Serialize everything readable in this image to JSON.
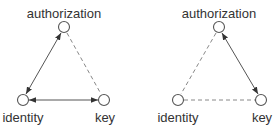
{
  "diagrams": [
    {
      "name": "left-triangle",
      "nodes": {
        "authorization": {
          "label": "authorization",
          "x": 64,
          "y": 27
        },
        "identity": {
          "label": "identity",
          "x": 23,
          "y": 100
        },
        "key": {
          "label": "key",
          "x": 104,
          "y": 100
        }
      },
      "edges": [
        {
          "from": "authorization",
          "to": "identity",
          "style": "solid",
          "arrows": "both"
        },
        {
          "from": "identity",
          "to": "key",
          "style": "solid",
          "arrows": "both"
        },
        {
          "from": "authorization",
          "to": "key",
          "style": "dashed",
          "arrows": "none"
        }
      ]
    },
    {
      "name": "right-triangle",
      "nodes": {
        "authorization": {
          "label": "authorization",
          "x": 219,
          "y": 27
        },
        "identity": {
          "label": "identity",
          "x": 178,
          "y": 100
        },
        "key": {
          "label": "key",
          "x": 261,
          "y": 100
        }
      },
      "edges": [
        {
          "from": "authorization",
          "to": "key",
          "style": "solid",
          "arrows": "both"
        },
        {
          "from": "authorization",
          "to": "identity",
          "style": "dashed",
          "arrows": "none"
        },
        {
          "from": "identity",
          "to": "key",
          "style": "dashed",
          "arrows": "none"
        }
      ]
    }
  ],
  "colors": {
    "line": "#555555",
    "dashed": "#888888",
    "text": "#333333",
    "background": "#ffffff"
  }
}
